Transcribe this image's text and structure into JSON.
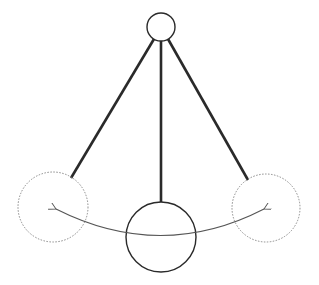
{
  "diagram": {
    "title": "Pendulum swing",
    "colors": {
      "background": "#ffffff",
      "rod": "#2a2a2a",
      "bob": "#2a2a2a",
      "ghost_bob": "#8a8a8a",
      "arc": "#555555"
    },
    "elements": {
      "pivot": "pivot",
      "center_bob": "bob at rest",
      "left_bob": "left extreme position",
      "right_bob": "right extreme position",
      "arc": "swing path"
    }
  }
}
